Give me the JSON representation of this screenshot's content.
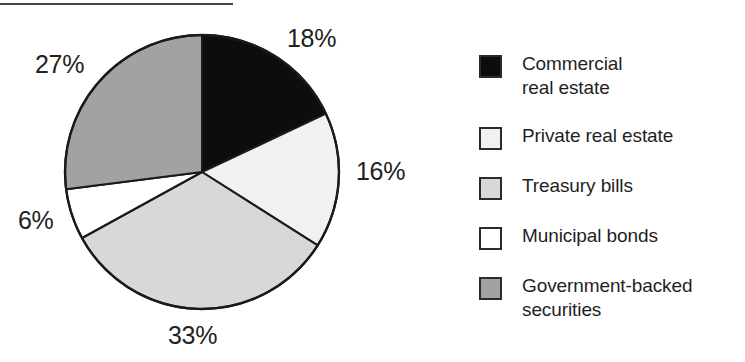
{
  "figure": {
    "rule_visible": true
  },
  "chart_data": {
    "type": "pie",
    "title": "",
    "subtitle": "",
    "xlabel": "",
    "ylabel": "",
    "grid": false,
    "legend_position": "right",
    "start_angle_deg": 0,
    "direction": "clockwise",
    "categories": [
      "Commercial real estate",
      "Private real estate",
      "Treasury bills",
      "Municipal bonds",
      "Government-backed securities"
    ],
    "values": [
      18,
      16,
      33,
      6,
      27
    ],
    "labels": [
      "18%",
      "16%",
      "33%",
      "6%",
      "27%"
    ],
    "colors": [
      "#0d0d0d",
      "#f2f1ef",
      "#d9d8d6",
      "#ffffff",
      "#a3a2a0"
    ],
    "edge_color": "#1a1a1a",
    "slices": [
      {
        "label": "18%",
        "value": 18,
        "category": "Commercial real estate",
        "color": "#0d0d0d",
        "start_deg": 0.0,
        "end_deg": 64.8
      },
      {
        "label": "16%",
        "value": 16,
        "category": "Private real estate",
        "color": "#f2f1ef",
        "start_deg": 64.8,
        "end_deg": 122.4
      },
      {
        "label": "33%",
        "value": 33,
        "category": "Treasury bills",
        "color": "#d9d8d6",
        "start_deg": 122.4,
        "end_deg": 241.2
      },
      {
        "label": "6%",
        "value": 6,
        "category": "Municipal bonds",
        "color": "#ffffff",
        "start_deg": 241.2,
        "end_deg": 262.8
      },
      {
        "label": "27%",
        "value": 27,
        "category": "Government-backed securities",
        "color": "#a3a2a0",
        "start_deg": 262.8,
        "end_deg": 360.0
      }
    ]
  },
  "legend": {
    "items": [
      {
        "label": "Commercial\nreal estate",
        "color": "#0d0d0d"
      },
      {
        "label": "Private real estate",
        "color": "#f2f1ef"
      },
      {
        "label": "Treasury bills",
        "color": "#d9d8d6"
      },
      {
        "label": "Municipal bonds",
        "color": "#ffffff"
      },
      {
        "label": "Government-backed\nsecurities",
        "color": "#a3a2a0"
      }
    ]
  }
}
